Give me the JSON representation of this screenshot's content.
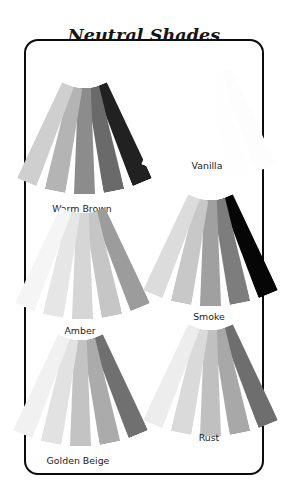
{
  "page": {
    "title": "Neutral Shades",
    "background_color": "#ffffff",
    "frame_color": "#0b0b0b",
    "label_color": "#1c1c1c"
  },
  "swatch_fans": [
    {
      "id": "warm-brown",
      "label": "Warm Brown",
      "strip_count": 5,
      "colors": [
        "#212121",
        "#6a6a6a",
        "#8c8c8c",
        "#b4b4b4",
        "#cfcfcf"
      ]
    },
    {
      "id": "vanilla",
      "label": "Vanilla",
      "strip_count": 5,
      "colors": [
        "#fdfdfd",
        "#fefefe",
        "#ffffff",
        "#ffffff",
        "#ffffff"
      ]
    },
    {
      "id": "amber",
      "label": "Amber",
      "strip_count": 5,
      "colors": [
        "#9c9c9c",
        "#c6c6c6",
        "#d6d6d6",
        "#e6e6e6",
        "#f5f5f5"
      ]
    },
    {
      "id": "smoke",
      "label": "Smoke",
      "strip_count": 5,
      "colors": [
        "#060606",
        "#7d7d7d",
        "#a0a0a0",
        "#c8c8c8",
        "#dcdcdc"
      ]
    },
    {
      "id": "golden-beige",
      "label": "Golden Beige",
      "strip_count": 5,
      "colors": [
        "#707070",
        "#ababab",
        "#c3c3c3",
        "#e2e2e2",
        "#f1f1f1"
      ]
    },
    {
      "id": "rust",
      "label": "Rust",
      "strip_count": 5,
      "colors": [
        "#6e6e6e",
        "#a8a8a8",
        "#c0c0c0",
        "#dadada",
        "#ededed"
      ]
    }
  ]
}
